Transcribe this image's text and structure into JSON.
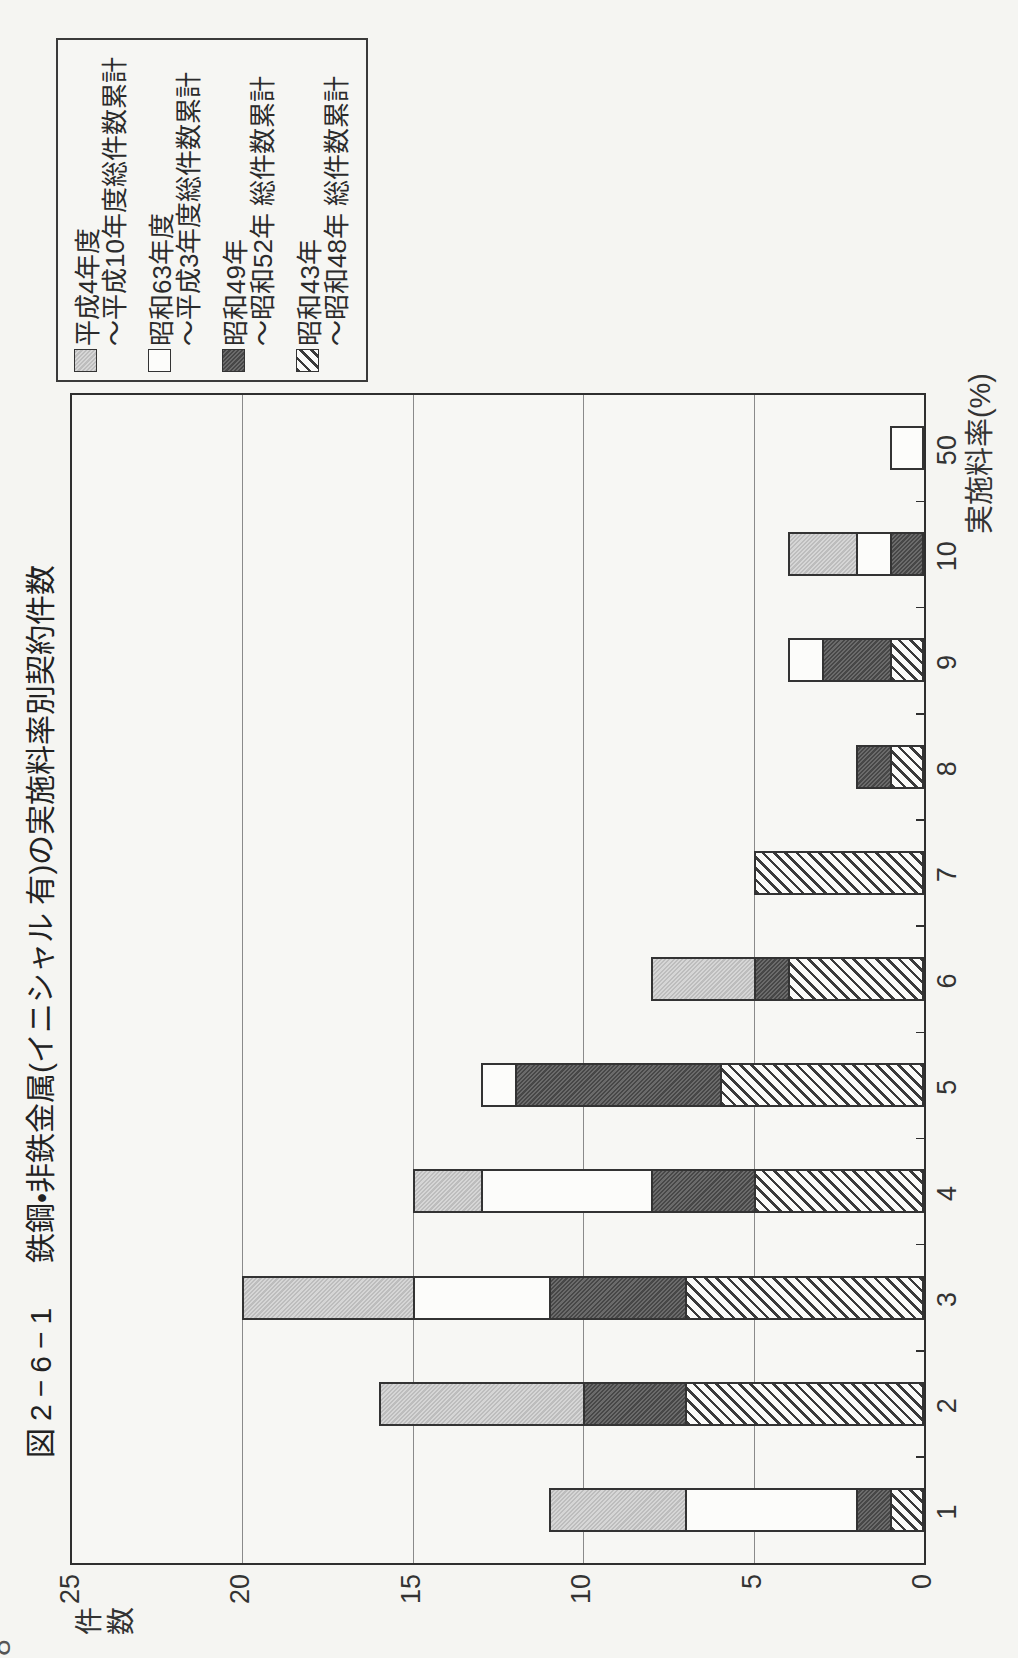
{
  "page": {
    "page_number_fragment": "8"
  },
  "chart": {
    "figure_no": "図2−6−1",
    "title": "鉄鋼・非鉄金属(イニシャル 有)の実施料率別契約件数"
  },
  "chart_data": {
    "type": "bar",
    "stacked": true,
    "page_rotation_deg": -90,
    "xlabel": "実施料率(%)",
    "ylabel": "件数",
    "ylim": [
      0,
      25
    ],
    "yticks": [
      0,
      5,
      10,
      15,
      20,
      25
    ],
    "grid": "horizontal value gridlines at 5,10,15,20",
    "legend_position": "outside right of plot (appears top-left on rotated page)",
    "categories": [
      "1",
      "2",
      "3",
      "4",
      "5",
      "6",
      "7",
      "8",
      "9",
      "10",
      "50"
    ],
    "series": [
      {
        "name": "昭和43年〜昭和48年 総件数累計",
        "legend_lines": [
          "昭和43年",
          "〜昭和48年 総件数累計"
        ],
        "pattern": "diagonal-hatch",
        "values": [
          1,
          7,
          7,
          5,
          6,
          4,
          5,
          1,
          1,
          0,
          0
        ]
      },
      {
        "name": "昭和49年〜昭和52年 総件数累計",
        "legend_lines": [
          "昭和49年",
          "〜昭和52年 総件数累計"
        ],
        "pattern": "dark-gray",
        "values": [
          1,
          3,
          4,
          3,
          6,
          1,
          0,
          1,
          2,
          1,
          0
        ]
      },
      {
        "name": "昭和63年度〜平成3年度総件数累計",
        "legend_lines": [
          "昭和63年度",
          "〜平成3年度総件数累計"
        ],
        "pattern": "white",
        "values": [
          5,
          0,
          4,
          5,
          1,
          0,
          0,
          0,
          1,
          1,
          1
        ]
      },
      {
        "name": "平成4年度〜平成10年度総件数累計",
        "legend_lines": [
          "平成4年度",
          "〜平成10年度総件数累計"
        ],
        "pattern": "light-gray",
        "values": [
          4,
          6,
          5,
          2,
          0,
          3,
          0,
          0,
          0,
          2,
          0
        ]
      }
    ],
    "totals_by_category": [
      11,
      16,
      20,
      15,
      13,
      8,
      5,
      2,
      4,
      4,
      1
    ],
    "colors": {
      "outline": "#333333",
      "light_gray_fill": "#cccccc",
      "dark_gray_fill": "#5c5c5c",
      "white_fill": "#fcfcfa",
      "hatch_line": "#3a3a3a",
      "paper": "#f5f5f2"
    }
  }
}
